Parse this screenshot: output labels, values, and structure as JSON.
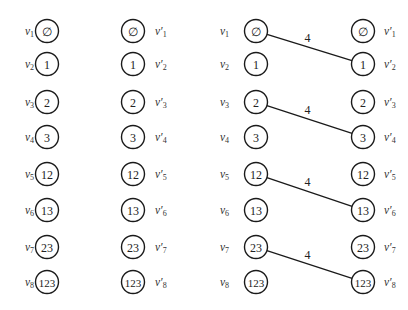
{
  "diagram": {
    "type": "bipartite-graph-pair",
    "layout": {
      "row_y": [
        31,
        64,
        102,
        137,
        174,
        210,
        247,
        282
      ],
      "radius": 11.5
    },
    "panels": [
      {
        "id": "left-panel",
        "left_column_x": 47,
        "right_column_x": 133,
        "left_label_x": 25,
        "right_label_x": 155,
        "left_nodes": [
          {
            "label": "v",
            "sub": "1",
            "text": "∅"
          },
          {
            "label": "v",
            "sub": "2",
            "text": "1"
          },
          {
            "label": "v",
            "sub": "3",
            "text": "2"
          },
          {
            "label": "v",
            "sub": "4",
            "text": "3"
          },
          {
            "label": "v",
            "sub": "5",
            "text": "12"
          },
          {
            "label": "v",
            "sub": "6",
            "text": "13"
          },
          {
            "label": "v",
            "sub": "7",
            "text": "23"
          },
          {
            "label": "v",
            "sub": "8",
            "text": "123"
          }
        ],
        "right_nodes": [
          {
            "label": "v′",
            "sub": "1",
            "text": "∅"
          },
          {
            "label": "v′",
            "sub": "2",
            "text": "1"
          },
          {
            "label": "v′",
            "sub": "3",
            "text": "2"
          },
          {
            "label": "v′",
            "sub": "4",
            "text": "3"
          },
          {
            "label": "v′",
            "sub": "5",
            "text": "12"
          },
          {
            "label": "v′",
            "sub": "6",
            "text": "13"
          },
          {
            "label": "v′",
            "sub": "7",
            "text": "23"
          },
          {
            "label": "v′",
            "sub": "8",
            "text": "123"
          }
        ],
        "edges": []
      },
      {
        "id": "right-panel",
        "left_column_x": 256,
        "right_column_x": 363,
        "left_label_x": 220,
        "right_label_x": 384,
        "left_nodes": [
          {
            "label": "v",
            "sub": "1",
            "text": "∅"
          },
          {
            "label": "v",
            "sub": "2",
            "text": "1"
          },
          {
            "label": "v",
            "sub": "3",
            "text": "2"
          },
          {
            "label": "v",
            "sub": "4",
            "text": "3"
          },
          {
            "label": "v",
            "sub": "5",
            "text": "12"
          },
          {
            "label": "v",
            "sub": "6",
            "text": "13"
          },
          {
            "label": "v",
            "sub": "7",
            "text": "23"
          },
          {
            "label": "v",
            "sub": "8",
            "text": "123"
          }
        ],
        "right_nodes": [
          {
            "label": "v′",
            "sub": "1",
            "text": "∅"
          },
          {
            "label": "v′",
            "sub": "2",
            "text": "1"
          },
          {
            "label": "v′",
            "sub": "3",
            "text": "2"
          },
          {
            "label": "v′",
            "sub": "4",
            "text": "3"
          },
          {
            "label": "v′",
            "sub": "5",
            "text": "12"
          },
          {
            "label": "v′",
            "sub": "6",
            "text": "13"
          },
          {
            "label": "v′",
            "sub": "7",
            "text": "23"
          },
          {
            "label": "v′",
            "sub": "8",
            "text": "123"
          }
        ],
        "edges": [
          {
            "from": 0,
            "to": 1,
            "weight": "4"
          },
          {
            "from": 2,
            "to": 3,
            "weight": "4"
          },
          {
            "from": 4,
            "to": 5,
            "weight": "4"
          },
          {
            "from": 6,
            "to": 7,
            "weight": "4"
          }
        ]
      }
    ]
  }
}
